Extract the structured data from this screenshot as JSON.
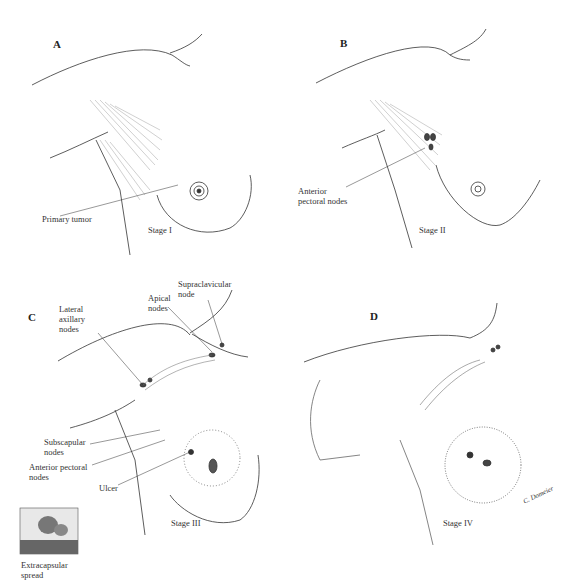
{
  "panels": [
    {
      "id": "A",
      "letter": "A",
      "stage": "Stage I",
      "labels": [
        {
          "text": "Primary tumor"
        }
      ]
    },
    {
      "id": "B",
      "letter": "B",
      "stage": "Stage II",
      "labels": [
        {
          "text": "Anterior\npectoral nodes"
        }
      ]
    },
    {
      "id": "C",
      "letter": "C",
      "stage": "Stage III",
      "labels": [
        {
          "text": "Lateral\naxillary\nnodes"
        },
        {
          "text": "Apical\nnodes"
        },
        {
          "text": "Supraclavicular\nnode"
        },
        {
          "text": "Subscapular\nnodes"
        },
        {
          "text": "Anterior pectoral\nnodes"
        },
        {
          "text": "Ulcer"
        }
      ],
      "inset": {
        "caption": "Extracapsular\nspread"
      }
    },
    {
      "id": "D",
      "letter": "D",
      "stage": "Stage IV",
      "signature": "C. Domeier"
    }
  ],
  "colors": {
    "line": "#333333",
    "hatch": "#777777",
    "node": "#444444"
  }
}
